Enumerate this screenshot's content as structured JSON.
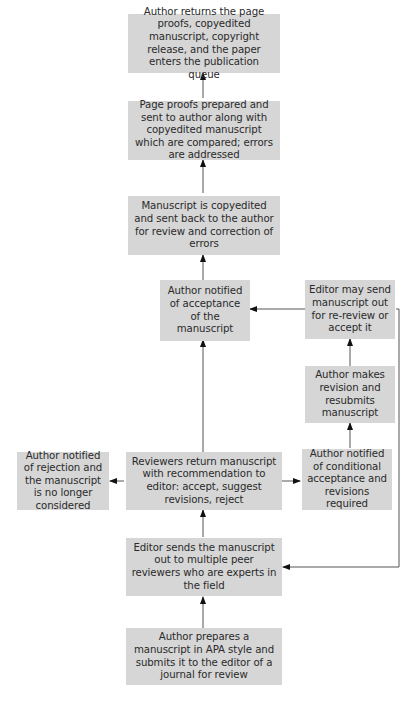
{
  "flowchart": {
    "title": "",
    "nodes": {
      "returns_proofs": "Author returns the page proofs, copyedited manuscript, copyright release, and the paper enters the publication queue",
      "page_proofs": "Page proofs prepared and sent to author along with copyedited manuscript which are compared; errors are addressed",
      "copyedited": "Manuscript is copyedited and sent back to the author for review and correction of errors",
      "acceptance": "Author notified of acceptance of the manuscript",
      "editor_rereview": "Editor may send manuscript out for re-review or accept it",
      "author_revision": "Author makes revision and resubmits manuscript",
      "rejection": "Author notified of rejection and the manuscript is no longer considered",
      "reviewers_return": "Reviewers return manuscript with recommendation to editor: accept, suggest revisions, reject",
      "conditional": "Author notified of conditional acceptance and revisions required",
      "editor_sends": "Editor sends the manuscript out to multiple peer reviewers who are experts in the field",
      "author_prepares": "Author prepares a manuscript in APA style and submits it to the editor of a journal for review"
    },
    "edges": [
      [
        "author_prepares",
        "editor_sends"
      ],
      [
        "editor_sends",
        "reviewers_return"
      ],
      [
        "reviewers_return",
        "rejection"
      ],
      [
        "reviewers_return",
        "conditional"
      ],
      [
        "reviewers_return",
        "acceptance"
      ],
      [
        "conditional",
        "author_revision"
      ],
      [
        "author_revision",
        "editor_rereview"
      ],
      [
        "editor_rereview",
        "acceptance"
      ],
      [
        "editor_rereview",
        "editor_sends"
      ],
      [
        "acceptance",
        "copyedited"
      ],
      [
        "copyedited",
        "page_proofs"
      ],
      [
        "page_proofs",
        "returns_proofs"
      ]
    ],
    "colors": {
      "box_fill": "#d6d6d6",
      "line": "#555555",
      "text": "#2a2a2a"
    }
  }
}
